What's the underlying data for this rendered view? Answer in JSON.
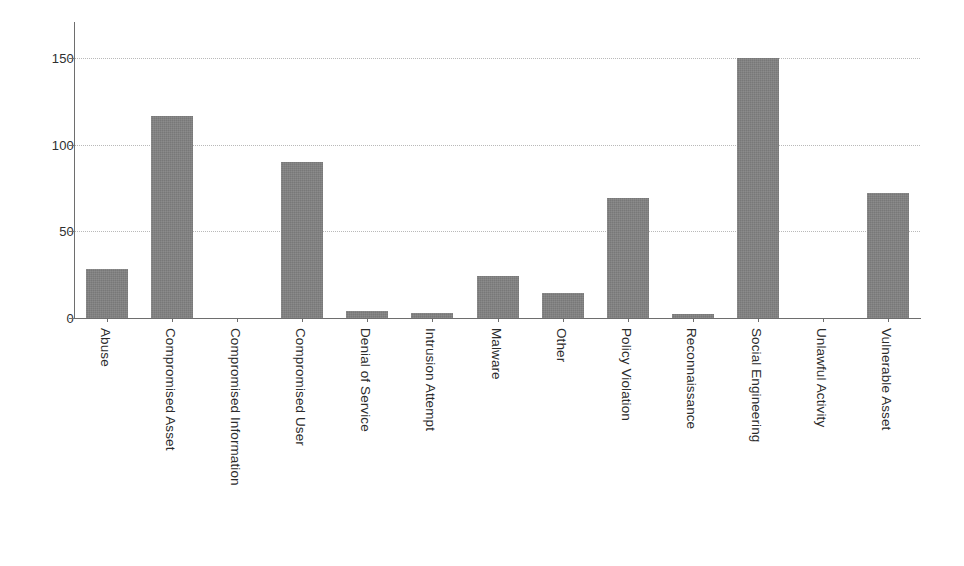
{
  "chart_data": {
    "type": "bar",
    "title": "",
    "subtitle": "",
    "xlabel": "",
    "ylabel": "",
    "categories": [
      "Abuse",
      "Compromised Asset",
      "Compromised Information",
      "Compromised User",
      "Denial of Service",
      "Intrusion Attempt",
      "Malware",
      "Other",
      "Policy Violation",
      "Reconnaissance",
      "Social Engineering",
      "Unlawful Activity",
      "Vulnerable Asset"
    ],
    "values": [
      27,
      111,
      0,
      86,
      4,
      3,
      23,
      14,
      66,
      2,
      143,
      0,
      69
    ],
    "ylim": [
      0,
      163
    ],
    "yticks": [
      0,
      50,
      100,
      150
    ],
    "ytick_labels": [
      "0",
      "50",
      "100",
      "150"
    ],
    "grid": true,
    "grid_axis": "y",
    "legend": false,
    "legend_position": "none",
    "bar_color": "#808080",
    "axis_color": "#6e6e6e",
    "gridline_color": "#b9b9b9",
    "background_color": "#ffffff",
    "xtick_rotation": 90
  }
}
